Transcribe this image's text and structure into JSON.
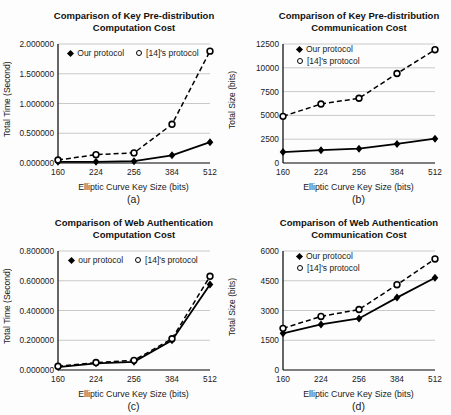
{
  "page": {
    "background": "#fdfdfd"
  },
  "colors": {
    "grid": "#c9c9c9",
    "axis": "#000000",
    "text": "#1a1a1a",
    "series": "#000000"
  },
  "chart_data": [
    {
      "id": "a",
      "type": "line",
      "title": "Comparison of Key Pre-distribution Computation Cost",
      "xlabel": "Elliptic Curve Key Size (bits)",
      "ylabel": "Total Time (Second)",
      "sublabel": "(a)",
      "categories": [
        "160",
        "224",
        "256",
        "384",
        "512"
      ],
      "ylim": [
        0,
        2
      ],
      "ytick_labels": [
        "0.000000",
        "0.500000",
        "1.000000",
        "1.500000",
        "2.000000"
      ],
      "grid": true,
      "legend_position": "top-center-horizontal",
      "series": [
        {
          "name": "Our protocol",
          "marker": "filled-diamond",
          "line": "solid",
          "color": "#000000",
          "values": [
            0.02,
            0.02,
            0.03,
            0.13,
            0.35
          ]
        },
        {
          "name": "[14]'s protocol",
          "marker": "open-circle",
          "line": "dashed",
          "color": "#000000",
          "values": [
            0.05,
            0.14,
            0.17,
            0.65,
            1.88
          ]
        }
      ]
    },
    {
      "id": "b",
      "type": "line",
      "title": "Comparison of Key Pre-distribution Communication Cost",
      "xlabel": "Elliptic Curve Key Size (bits)",
      "ylabel": "Total Size (bits)",
      "sublabel": "(b)",
      "categories": [
        "160",
        "224",
        "256",
        "384",
        "512"
      ],
      "ylim": [
        0,
        12500
      ],
      "ytick_labels": [
        "0",
        "2500",
        "5000",
        "7500",
        "10000",
        "12500"
      ],
      "grid": true,
      "legend_position": "top-left-vertical",
      "series": [
        {
          "name": "Our protocol",
          "marker": "filled-diamond",
          "line": "solid",
          "color": "#000000",
          "values": [
            1150,
            1350,
            1500,
            2000,
            2550
          ]
        },
        {
          "name": "[14]'s protocol",
          "marker": "open-circle",
          "line": "dashed",
          "color": "#000000",
          "values": [
            4900,
            6200,
            6800,
            9400,
            11900
          ]
        }
      ]
    },
    {
      "id": "c",
      "type": "line",
      "title": "Comparison of Web Authentication Computation Cost",
      "xlabel": "Elliptic Curve Key Size (bits)",
      "ylabel": "Total Time (Second)",
      "sublabel": "(c)",
      "categories": [
        "160",
        "224",
        "256",
        "384",
        "512"
      ],
      "ylim": [
        0,
        0.8
      ],
      "ytick_labels": [
        "0.000000",
        "0.200000",
        "0.400000",
        "0.600000",
        "0.800000"
      ],
      "grid": true,
      "legend_position": "top-center-horizontal",
      "series": [
        {
          "name": "our protocol",
          "marker": "filled-diamond",
          "line": "solid",
          "color": "#000000",
          "values": [
            0.02,
            0.045,
            0.055,
            0.2,
            0.575
          ]
        },
        {
          "name": "[14]'s protocol",
          "marker": "open-circle",
          "line": "dashed",
          "color": "#000000",
          "values": [
            0.025,
            0.05,
            0.065,
            0.21,
            0.63
          ]
        }
      ]
    },
    {
      "id": "d",
      "type": "line",
      "title": "Comparison of Web Authentication Communication Cost",
      "xlabel": "Elliptic Curve Key Size (bits)",
      "ylabel": "Total Size (bits)",
      "sublabel": "(d)",
      "categories": [
        "160",
        "224",
        "256",
        "384",
        "512"
      ],
      "ylim": [
        0,
        6000
      ],
      "ytick_labels": [
        "0",
        "1500",
        "3000",
        "4500",
        "6000"
      ],
      "grid": true,
      "legend_position": "top-left-vertical",
      "series": [
        {
          "name": "Our protocol",
          "marker": "filled-diamond",
          "line": "solid",
          "color": "#000000",
          "values": [
            1850,
            2300,
            2600,
            3650,
            4650
          ]
        },
        {
          "name": "[14]'s protocol",
          "marker": "open-circle",
          "line": "dashed",
          "color": "#000000",
          "values": [
            2100,
            2700,
            3050,
            4300,
            5600
          ]
        }
      ]
    }
  ]
}
